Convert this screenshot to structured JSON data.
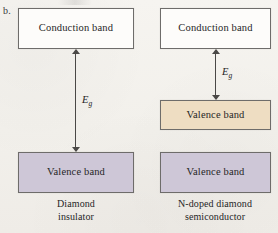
{
  "figure": {
    "panel_label": "b.",
    "diagrams": [
      {
        "id": "diamond-insulator",
        "conduction_band_label": "Conduction band",
        "valence_band_label": "Valence band",
        "gap_label": "E",
        "gap_subscript": "g",
        "caption_line1": "Diamond",
        "caption_line2": "insulator",
        "conduction_color": "#fdfcfa",
        "valence_color": "#cec7d7"
      },
      {
        "id": "n-doped-diamond-semiconductor",
        "conduction_band_label": "Conduction band",
        "donor_band_label": "Valence band",
        "valence_band_label": "Valence band",
        "gap_label": "E",
        "gap_subscript": "g",
        "caption_line1": "N-doped diamond",
        "caption_line2": "semiconductor",
        "conduction_color": "#fdfcfa",
        "donor_color": "#eeddc2",
        "valence_color": "#cec7d7"
      }
    ]
  }
}
